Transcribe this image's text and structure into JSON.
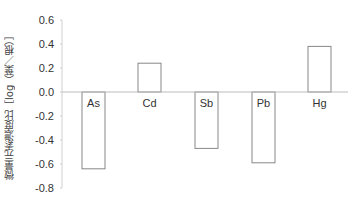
{
  "chart_data": {
    "type": "bar",
    "title": "",
    "xlabel": "",
    "ylabel": "微量元素濃度比［log（葉／根）］",
    "categories": [
      "As",
      "Cd",
      "Sb",
      "Pb",
      "Hg"
    ],
    "values": [
      -0.64,
      0.24,
      -0.47,
      -0.59,
      0.38
    ],
    "ylim": [
      -0.8,
      0.6
    ],
    "yticks": [
      0.6,
      0.4,
      0.2,
      0.0,
      -0.2,
      -0.4,
      -0.6,
      -0.8
    ],
    "ytick_labels": [
      "0.6",
      "0.4",
      "0.2",
      "0.0",
      "-0.2",
      "-0.4",
      "-0.6",
      "-0.8"
    ],
    "grid": false,
    "legend": null,
    "bar_fill": "#ffffff",
    "bar_stroke": "#888888",
    "axis_color": "#bbbbbb"
  }
}
